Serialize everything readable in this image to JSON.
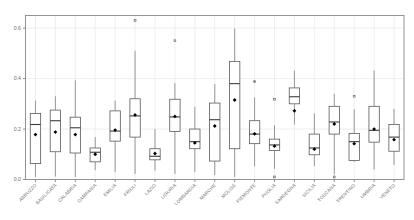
{
  "chart_data": {
    "type": "box",
    "title": "",
    "xlabel": "",
    "ylabel": "",
    "ylim": [
      0.0,
      0.65
    ],
    "yticks": [
      0.0,
      0.2,
      0.4,
      0.6
    ],
    "ytick_labels": [
      "0.0",
      "0.2",
      "0.4",
      "0.6"
    ],
    "grid": true,
    "legend": "none",
    "mean_marker": "filled-diamond",
    "categories": [
      "ABRUZZO",
      "BASILICATA",
      "CALABRIA",
      "CAMPANIA",
      "EMILIA",
      "FRIULI",
      "LAZIO",
      "LIGURIA",
      "LOMBARDIA",
      "MARCHE",
      "MOLISE",
      "PIEMONTE",
      "PUGLIA",
      "SARDEGNA",
      "SICILIA",
      "TOSCANA",
      "TRENTINO",
      "UMBRIA",
      "VENETO"
    ],
    "boxes": [
      {
        "category": "ABRUZZO",
        "whisker_low": 0.01,
        "q1": 0.063,
        "median": 0.218,
        "q3": 0.262,
        "whisker_high": 0.313,
        "mean": 0.178,
        "outliers": []
      },
      {
        "category": "BASILICATA",
        "whisker_low": 0.012,
        "q1": 0.11,
        "median": 0.233,
        "q3": 0.275,
        "whisker_high": 0.33,
        "mean": 0.188,
        "outliers": []
      },
      {
        "category": "CALABRIA",
        "whisker_low": 0.01,
        "q1": 0.105,
        "median": 0.205,
        "q3": 0.247,
        "whisker_high": 0.393,
        "mean": 0.178,
        "outliers": []
      },
      {
        "category": "CAMPANIA",
        "whisker_low": 0.037,
        "q1": 0.07,
        "median": 0.108,
        "q3": 0.125,
        "whisker_high": 0.168,
        "mean": 0.1,
        "outliers": []
      },
      {
        "category": "EMILIA",
        "whisker_low": 0.03,
        "q1": 0.152,
        "median": 0.192,
        "q3": 0.272,
        "whisker_high": 0.312,
        "mean": 0.196,
        "outliers": []
      },
      {
        "category": "FRIULI",
        "whisker_low": 0.022,
        "q1": 0.168,
        "median": 0.252,
        "q3": 0.32,
        "whisker_high": 0.51,
        "mean": 0.256,
        "outliers": [
          0.63
        ]
      },
      {
        "category": "LAZIO",
        "whisker_low": 0.035,
        "q1": 0.078,
        "median": 0.092,
        "q3": 0.122,
        "whisker_high": 0.2,
        "mean": 0.103,
        "outliers": []
      },
      {
        "category": "LIGURIA",
        "whisker_low": 0.022,
        "q1": 0.19,
        "median": 0.248,
        "q3": 0.318,
        "whisker_high": 0.382,
        "mean": 0.25,
        "outliers": [
          0.55
        ]
      },
      {
        "category": "LOMBARDIA",
        "whisker_low": 0.03,
        "q1": 0.122,
        "median": 0.15,
        "q3": 0.2,
        "whisker_high": 0.288,
        "mean": 0.145,
        "outliers": []
      },
      {
        "category": "MARCHE",
        "whisker_low": 0.018,
        "q1": 0.073,
        "median": 0.237,
        "q3": 0.303,
        "whisker_high": 0.378,
        "mean": 0.212,
        "outliers": []
      },
      {
        "category": "MOLISE",
        "whisker_low": 0.01,
        "q1": 0.122,
        "median": 0.38,
        "q3": 0.468,
        "whisker_high": 0.598,
        "mean": 0.315,
        "outliers": []
      },
      {
        "category": "PIEMONTE",
        "whisker_low": 0.052,
        "q1": 0.142,
        "median": 0.18,
        "q3": 0.233,
        "whisker_high": 0.325,
        "mean": 0.181,
        "outliers": [
          0.388
        ]
      },
      {
        "category": "PUGLIA",
        "whisker_low": 0.042,
        "q1": 0.115,
        "median": 0.137,
        "q3": 0.16,
        "whisker_high": 0.215,
        "mean": 0.132,
        "outliers": [
          0.01,
          0.318
        ]
      },
      {
        "category": "SARDEGNA",
        "whisker_low": 0.218,
        "q1": 0.3,
        "median": 0.328,
        "q3": 0.363,
        "whisker_high": 0.432,
        "mean": 0.272,
        "outliers": []
      },
      {
        "category": "SICILIA",
        "whisker_low": 0.053,
        "q1": 0.098,
        "median": 0.125,
        "q3": 0.18,
        "whisker_high": 0.262,
        "mean": 0.12,
        "outliers": []
      },
      {
        "category": "TOSCANA",
        "whisker_low": 0.02,
        "q1": 0.18,
        "median": 0.228,
        "q3": 0.29,
        "whisker_high": 0.34,
        "mean": 0.22,
        "outliers": [
          0.01
        ]
      },
      {
        "category": "TRENTINO",
        "whisker_low": 0.07,
        "q1": 0.075,
        "median": 0.15,
        "q3": 0.182,
        "whisker_high": 0.278,
        "mean": 0.142,
        "outliers": [
          0.33
        ]
      },
      {
        "category": "UMBRIA",
        "whisker_low": 0.04,
        "q1": 0.148,
        "median": 0.195,
        "q3": 0.29,
        "whisker_high": 0.432,
        "mean": 0.2,
        "outliers": []
      },
      {
        "category": "VENETO",
        "whisker_low": 0.058,
        "q1": 0.112,
        "median": 0.168,
        "q3": 0.218,
        "whisker_high": 0.28,
        "mean": 0.158,
        "outliers": []
      }
    ]
  },
  "style": {
    "box_stroke": "#5a5a5a",
    "box_fill": "#ffffff",
    "whisker_stroke": "#7a7a7a",
    "median_stroke": "#3c3c3c",
    "mean_fill": "#000000",
    "grid_color": "#e8e8e8",
    "frame_color": "#888888",
    "tick_label_color": "#6b6b6b",
    "background": "#ffffff"
  }
}
